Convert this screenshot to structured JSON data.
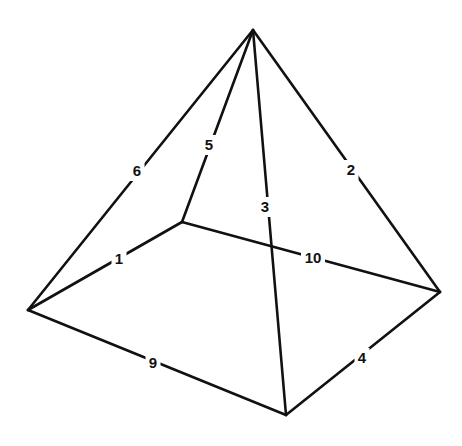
{
  "diagram": {
    "title": "",
    "shape": "square pyramid wireframe",
    "vertices": {
      "apex": [
        253,
        30
      ],
      "left": [
        28,
        310
      ],
      "back": [
        182,
        222
      ],
      "right": [
        440,
        292
      ],
      "front": [
        286,
        415
      ]
    },
    "edges": [
      {
        "id": "edge-1",
        "label": "1",
        "from": "left",
        "to": "back",
        "lx": 119,
        "ly": 259
      },
      {
        "id": "edge-2",
        "label": "2",
        "from": "apex",
        "to": "right",
        "lx": 351,
        "ly": 170
      },
      {
        "id": "edge-3",
        "label": "3",
        "from": "apex",
        "to": "front",
        "lx": 265,
        "ly": 207
      },
      {
        "id": "edge-4",
        "label": "4",
        "from": "right",
        "to": "front",
        "lx": 362,
        "ly": 358
      },
      {
        "id": "edge-5",
        "label": "5",
        "from": "apex",
        "to": "back",
        "lx": 209,
        "ly": 145
      },
      {
        "id": "edge-6",
        "label": "6",
        "from": "apex",
        "to": "left",
        "lx": 137,
        "ly": 171
      },
      {
        "id": "edge-9",
        "label": "9",
        "from": "left",
        "to": "front",
        "lx": 153,
        "ly": 363
      },
      {
        "id": "edge-10",
        "label": "10",
        "from": "back",
        "to": "right",
        "lx": 313,
        "ly": 258
      }
    ]
  }
}
